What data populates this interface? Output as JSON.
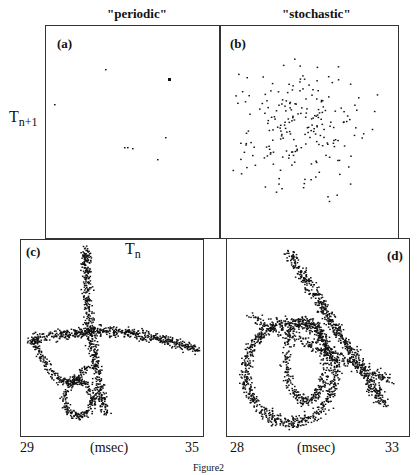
{
  "figure": {
    "caption": "Figure2",
    "top": {
      "left_title": "\"periodic\"",
      "right_title": "\"stochastic\"",
      "ylabel_main": "T",
      "ylabel_sub": "n+1",
      "xlabel_main": "T",
      "xlabel_sub": "n",
      "panel_a": "(a)",
      "panel_b": "(b)"
    },
    "bottom": {
      "panel_c": "(c)",
      "panel_d": "(d)",
      "c_xmin": "29",
      "c_xmax": "35",
      "c_unit": "(msec)",
      "d_xmin": "28",
      "d_xmax": "33",
      "d_unit": "(msec)"
    }
  },
  "chart_data": [
    {
      "type": "scatter",
      "panel": "(a)",
      "title": "\"periodic\"",
      "xlabel": "T_n",
      "ylabel": "T_n+1",
      "description": "Return map with a few isolated points (periodic)"
    },
    {
      "type": "scatter",
      "panel": "(b)",
      "title": "\"stochastic\"",
      "xlabel": "T_n",
      "ylabel": "T_n+1",
      "description": "Diffuse cloud of ~200 points (stochastic)"
    },
    {
      "type": "scatter",
      "panel": "(c)",
      "xlabel": "(msec)",
      "xticks": [
        "29",
        "35"
      ],
      "xlim": [
        29,
        35
      ],
      "description": "Return map with crossing curved bands"
    },
    {
      "type": "scatter",
      "panel": "(d)",
      "xlabel": "(msec)",
      "xticks": [
        "28",
        "33"
      ],
      "xlim": [
        28,
        33
      ],
      "description": "Return map with looping curved bands"
    }
  ]
}
